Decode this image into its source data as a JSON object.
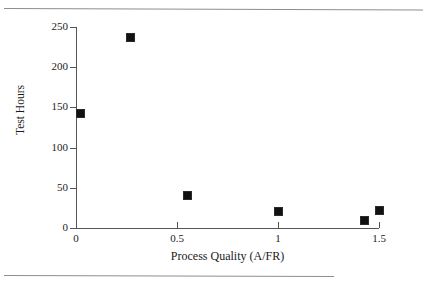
{
  "chart_data": {
    "type": "scatter",
    "title": "",
    "xlabel": "Process Quality (A/FR)",
    "ylabel": "Test Hours",
    "xlim": [
      0,
      1.5
    ],
    "ylim": [
      0,
      250
    ],
    "grid": false,
    "legend": null,
    "marker_style": "filled-square",
    "marker_color": "#111111",
    "xticks": [
      0,
      0.5,
      1,
      1.5
    ],
    "xtick_labels": [
      "0",
      "0.5",
      "1",
      "1.5"
    ],
    "yticks": [
      0,
      50,
      100,
      150,
      200,
      250
    ],
    "ytick_labels": [
      "0",
      "50",
      "100",
      "150",
      "200",
      "250"
    ],
    "points": [
      {
        "x": 0.02,
        "y": 142
      },
      {
        "x": 0.27,
        "y": 237
      },
      {
        "x": 0.55,
        "y": 40
      },
      {
        "x": 1.0,
        "y": 21
      },
      {
        "x": 1.43,
        "y": 9
      },
      {
        "x": 1.5,
        "y": 22
      }
    ]
  },
  "figure": {
    "background_color": "#ffffff",
    "axis_color": "#555555",
    "rule_color": "#8d8d8d"
  }
}
